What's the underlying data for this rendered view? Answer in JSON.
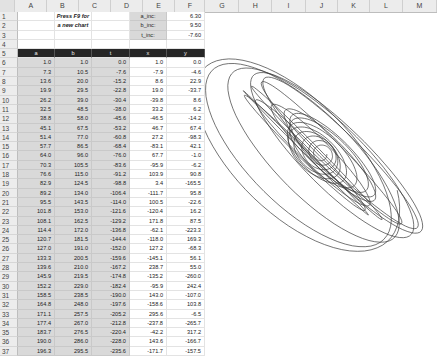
{
  "columns": [
    "A",
    "B",
    "C",
    "D",
    "E",
    "F",
    "G",
    "H",
    "I",
    "J",
    "K",
    "L",
    "M"
  ],
  "instruction": {
    "line1": "Press F9 for",
    "line2": "a new chart"
  },
  "params": [
    {
      "label": "a_inc:",
      "value": "6.30"
    },
    {
      "label": "b_inc:",
      "value": "9.50"
    },
    {
      "label": "t_inc:",
      "value": "-7.60"
    }
  ],
  "table": {
    "headers": [
      "a",
      "b",
      "t",
      "x",
      "y"
    ],
    "rows": [
      [
        "1.0",
        "1.0",
        "0.0",
        "1.0",
        "0.0"
      ],
      [
        "7.3",
        "10.5",
        "-7.6",
        "-7.9",
        "-4.6"
      ],
      [
        "13.6",
        "20.0",
        "-15.2",
        "8.6",
        "22.9"
      ],
      [
        "19.9",
        "29.5",
        "-22.8",
        "19.0",
        "-33.7"
      ],
      [
        "26.2",
        "39.0",
        "-30.4",
        "-39.8",
        "8.6"
      ],
      [
        "32.5",
        "48.5",
        "-38.0",
        "33.2",
        "6.2"
      ],
      [
        "38.8",
        "58.0",
        "-45.6",
        "-46.5",
        "-14.2"
      ],
      [
        "45.1",
        "67.5",
        "-53.2",
        "46.7",
        "67.4"
      ],
      [
        "51.4",
        "77.0",
        "-60.8",
        "27.2",
        "-98.3"
      ],
      [
        "57.7",
        "86.5",
        "-68.4",
        "-83.1",
        "42.1"
      ],
      [
        "64.0",
        "96.0",
        "-76.0",
        "67.7",
        "-1.0"
      ],
      [
        "70.3",
        "105.5",
        "-83.6",
        "-95.9",
        "-6.2"
      ],
      [
        "76.6",
        "115.0",
        "-91.2",
        "103.9",
        "90.8"
      ],
      [
        "82.9",
        "124.5",
        "-98.8",
        "3.4",
        "-165.5"
      ],
      [
        "89.2",
        "134.0",
        "-106.4",
        "-111.7",
        "95.8"
      ],
      [
        "95.5",
        "143.5",
        "-114.0",
        "100.5",
        "-22.6"
      ],
      [
        "101.8",
        "153.0",
        "-121.6",
        "-120.4",
        "16.2"
      ],
      [
        "108.1",
        "162.5",
        "-129.2",
        "171.8",
        "87.5"
      ],
      [
        "114.4",
        "172.0",
        "-136.8",
        "-62.1",
        "-223.3"
      ],
      [
        "120.7",
        "181.5",
        "-144.4",
        "-118.0",
        "169.3"
      ],
      [
        "127.0",
        "191.0",
        "-152.0",
        "127.2",
        "-68.3"
      ],
      [
        "133.3",
        "200.5",
        "-159.6",
        "-145.1",
        "56.1"
      ],
      [
        "139.6",
        "210.0",
        "-167.2",
        "238.7",
        "55.0"
      ],
      [
        "145.9",
        "219.5",
        "-174.8",
        "-135.2",
        "-260.0"
      ],
      [
        "152.2",
        "229.0",
        "-182.4",
        "-95.9",
        "242.4"
      ],
      [
        "158.5",
        "238.5",
        "-190.0",
        "143.0",
        "-107.0"
      ],
      [
        "164.8",
        "248.0",
        "-197.6",
        "-158.6",
        "103.8"
      ],
      [
        "171.1",
        "257.5",
        "-205.2",
        "295.6",
        "-6.5"
      ],
      [
        "177.4",
        "267.0",
        "-212.8",
        "-237.8",
        "-265.7"
      ],
      [
        "183.7",
        "276.5",
        "-220.4",
        "-42.2",
        "317.2"
      ],
      [
        "190.0",
        "286.0",
        "-228.0",
        "143.6",
        "-166.7"
      ],
      [
        "196.3",
        "295.5",
        "-235.6",
        "-171.7",
        "-157.5"
      ]
    ]
  },
  "chart": {
    "type": "scatter-line",
    "line_color": "#3a3a3a"
  }
}
